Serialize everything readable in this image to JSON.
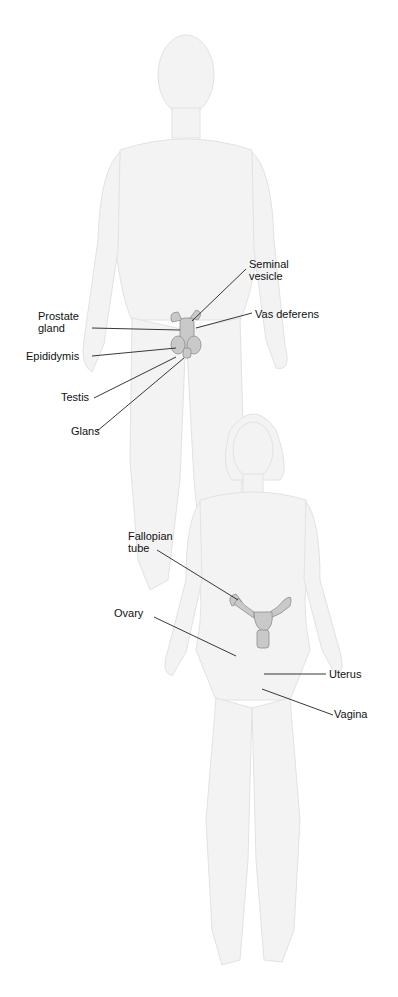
{
  "diagram": {
    "type": "anatomical-labeled-illustration",
    "figures": [
      {
        "name": "male",
        "labels": [
          {
            "id": "seminal_vesicle",
            "text": "Seminal\nvesicle"
          },
          {
            "id": "vas_deferens",
            "text": "Vas deferens"
          },
          {
            "id": "prostate_gland",
            "text": "Prostate\ngland"
          },
          {
            "id": "epididymis",
            "text": "Epididymis"
          },
          {
            "id": "testis",
            "text": "Testis"
          },
          {
            "id": "glans",
            "text": "Glans"
          }
        ]
      },
      {
        "name": "female",
        "labels": [
          {
            "id": "fallopian_tube",
            "text": "Fallopian\ntube"
          },
          {
            "id": "ovary",
            "text": "Ovary"
          },
          {
            "id": "uterus",
            "text": "Uterus"
          },
          {
            "id": "vagina",
            "text": "Vagina"
          }
        ]
      }
    ],
    "colors": {
      "body": "#f3f3f3",
      "organ": "#c9c9c9",
      "leader": "#222222"
    }
  }
}
